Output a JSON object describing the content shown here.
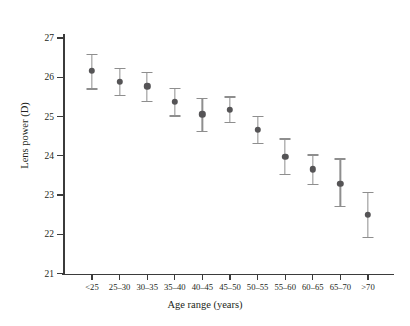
{
  "chart_data": {
    "type": "scatter",
    "title": "",
    "xlabel": "Age range (years)",
    "ylabel": "Lens power (D)",
    "categories": [
      "<25",
      "25–30",
      "30–35",
      "35–40",
      "40–45",
      "45–50",
      "50–55",
      "55–60",
      "60–65",
      "65–70",
      ">70"
    ],
    "values": [
      26.17,
      25.89,
      25.77,
      25.38,
      25.06,
      25.17,
      24.66,
      23.98,
      23.65,
      23.29,
      22.5
    ],
    "error_low": [
      25.7,
      25.54,
      25.39,
      25.01,
      24.62,
      24.84,
      24.31,
      23.52,
      23.27,
      22.7,
      21.92
    ],
    "error_high": [
      26.58,
      26.23,
      26.12,
      25.72,
      25.45,
      25.5,
      25.0,
      24.43,
      24.02,
      23.92,
      23.06
    ],
    "ylim": [
      21,
      27
    ],
    "yticks": [
      21,
      22,
      23,
      24,
      25,
      26,
      27
    ],
    "ytick_labels": [
      "21",
      "22",
      "23",
      "24",
      "25",
      "26",
      "27"
    ],
    "grid": false,
    "legend": null,
    "marker_color": "#555456",
    "errorbar_color": "#8e8e8e",
    "axis_color": "#3b3b3b",
    "background": "#ffffff"
  }
}
